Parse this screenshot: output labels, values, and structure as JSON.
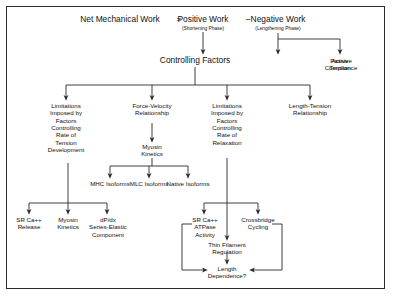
{
  "diagram": {
    "title_row": {
      "net": "Net Mechanical Work",
      "equals": "=",
      "positive": "Positive Work",
      "minus": "–",
      "negative": "Negative Work",
      "positive_sub": "(Shortening Phase)",
      "negative_sub": "(Lengthening Phase)"
    },
    "controlling_factors": "Controlling Factors",
    "negative_branch": [
      {
        "label": "Active\nTension"
      },
      {
        "label": "Passive\nCompliance"
      }
    ],
    "level2": [
      {
        "label": "Limitations\nImposed by\nFactors\nControlling\nRate of\nTension\nDevelopment"
      },
      {
        "label": "Force-Velocity\nRelationship"
      },
      {
        "label": "Limitations\nImposed by\nFactors\nControlling\nRate of\nRelaxation"
      },
      {
        "label": "Length-Tension\nRelationship"
      }
    ],
    "myosin_kinetics": "Myosin\nKinetics",
    "isoforms": [
      {
        "label": "MHC Isoforms"
      },
      {
        "label": "MLC Isoforms"
      },
      {
        "label": "Native Isoforms"
      }
    ],
    "tension_children": [
      {
        "label": "SR Ca++\nRelease"
      },
      {
        "label": "Myosin\nKinetics"
      },
      {
        "label": "dP/dx\nSeries-Elastic\nComponent"
      }
    ],
    "relaxation_children": [
      {
        "label": "SR Ca++\nATPase\nActivity"
      },
      {
        "label": "Crossbridge\nCycling"
      }
    ],
    "thin_filament_regulation": "Thin Filament\nRegulation",
    "length_dependence": "Length\nDependence?",
    "colors": {
      "line": "#2b2b2b",
      "text": "#111111",
      "background": "#ffffff"
    }
  }
}
